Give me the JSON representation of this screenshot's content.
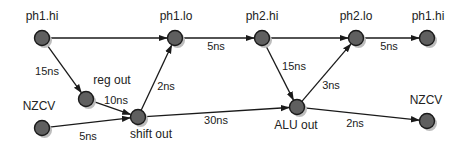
{
  "diagram": {
    "type": "timing-graph",
    "colors": {
      "node_fill": "#5f5f5f",
      "node_stroke": "#1a1a1a",
      "node_shadow": "#bdbdbd",
      "edge": "#1a1a1a",
      "text": "#222222",
      "background": "#ffffff"
    },
    "nodes": [
      {
        "id": "ph1_hi_a",
        "label": "ph1.hi",
        "x": 42,
        "y": 38,
        "label_x": 42,
        "label_y": 20,
        "anchor": "middle"
      },
      {
        "id": "ph1_lo",
        "label": "ph1.lo",
        "x": 175,
        "y": 38,
        "label_x": 176,
        "label_y": 20,
        "anchor": "middle"
      },
      {
        "id": "ph2_hi",
        "label": "ph2.hi",
        "x": 262,
        "y": 38,
        "label_x": 262,
        "label_y": 20,
        "anchor": "middle"
      },
      {
        "id": "ph2_lo",
        "label": "ph2.lo",
        "x": 356,
        "y": 38,
        "label_x": 356,
        "label_y": 20,
        "anchor": "middle"
      },
      {
        "id": "ph1_hi_b",
        "label": "ph1.hi",
        "x": 427,
        "y": 38,
        "label_x": 428,
        "label_y": 20,
        "anchor": "middle"
      },
      {
        "id": "reg_out",
        "label": "reg out",
        "x": 86,
        "y": 99,
        "label_x": 112,
        "label_y": 84,
        "anchor": "middle"
      },
      {
        "id": "nzcv_a",
        "label": "NZCV",
        "x": 42,
        "y": 128,
        "label_x": 39,
        "label_y": 110,
        "anchor": "middle"
      },
      {
        "id": "shift_out",
        "label": "shift out",
        "x": 138,
        "y": 117,
        "label_x": 151,
        "label_y": 138,
        "anchor": "middle"
      },
      {
        "id": "alu_out",
        "label": "ALU out",
        "x": 297,
        "y": 107,
        "label_x": 296,
        "label_y": 129,
        "anchor": "middle"
      },
      {
        "id": "nzcv_b",
        "label": "NZCV",
        "x": 427,
        "y": 121,
        "label_x": 426,
        "label_y": 104,
        "anchor": "middle"
      }
    ],
    "edges": [
      {
        "from": "ph1_hi_a",
        "to": "ph1_lo",
        "label": "",
        "label_x": 0,
        "label_y": 0
      },
      {
        "from": "ph1_hi_a",
        "to": "reg_out",
        "label": "15ns",
        "label_x": 47,
        "label_y": 75
      },
      {
        "from": "reg_out",
        "to": "shift_out",
        "label": "10ns",
        "label_x": 116,
        "label_y": 104
      },
      {
        "from": "nzcv_a",
        "to": "shift_out",
        "label": "5ns",
        "label_x": 88,
        "label_y": 140
      },
      {
        "from": "shift_out",
        "to": "ph1_lo",
        "label": "2ns",
        "label_x": 166,
        "label_y": 90
      },
      {
        "from": "ph1_lo",
        "to": "ph2_hi",
        "label": "5ns",
        "label_x": 216,
        "label_y": 50
      },
      {
        "from": "ph2_hi",
        "to": "ph2_lo",
        "label": "",
        "label_x": 0,
        "label_y": 0
      },
      {
        "from": "ph2_hi",
        "to": "alu_out",
        "label": "15ns",
        "label_x": 294,
        "label_y": 70
      },
      {
        "from": "alu_out",
        "to": "ph2_lo",
        "label": "3ns",
        "label_x": 331,
        "label_y": 89
      },
      {
        "from": "shift_out",
        "to": "alu_out",
        "label": "30ns",
        "label_x": 216,
        "label_y": 124
      },
      {
        "from": "ph2_lo",
        "to": "ph1_hi_b",
        "label": "5ns",
        "label_x": 389,
        "label_y": 50
      },
      {
        "from": "alu_out",
        "to": "nzcv_b",
        "label": "2ns",
        "label_x": 355,
        "label_y": 127
      }
    ]
  }
}
